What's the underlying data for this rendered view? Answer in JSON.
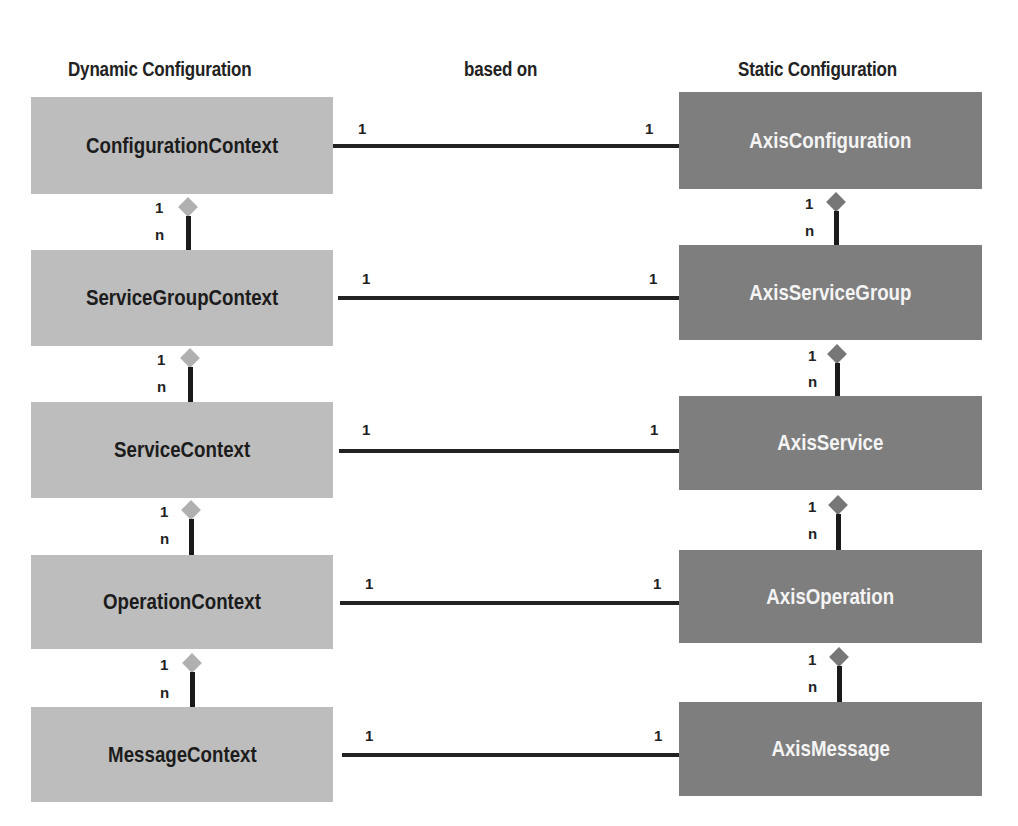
{
  "headers": {
    "left": "Dynamic Configuration",
    "middle": "based on",
    "right": "Static Configuration"
  },
  "dynamic": [
    {
      "label": "ConfigurationContext"
    },
    {
      "label": "ServiceGroupContext"
    },
    {
      "label": "ServiceContext"
    },
    {
      "label": "OperationContext"
    },
    {
      "label": "MessageContext"
    }
  ],
  "static": [
    {
      "label": "AxisConfiguration"
    },
    {
      "label": "AxisServiceGroup"
    },
    {
      "label": "AxisService"
    },
    {
      "label": "AxisOperation"
    },
    {
      "label": "AxisMessage"
    }
  ],
  "multiplicity": {
    "one": "1",
    "many": "n"
  },
  "colors": {
    "dynamic_box": "#bdbdbd",
    "static_box": "#7e7e7e",
    "line": "#222222"
  }
}
